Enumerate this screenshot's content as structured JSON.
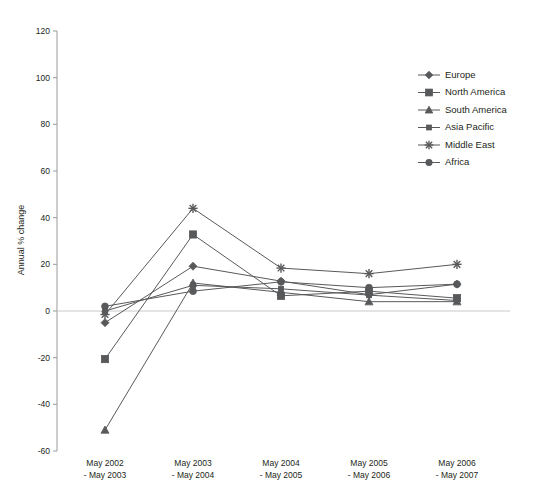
{
  "chart_data": {
    "type": "line",
    "title": "",
    "subtitle": "",
    "xlabel": "",
    "ylabel": "Annual % change",
    "ylim": [
      -60,
      120
    ],
    "yticks": [
      -60,
      -40,
      -20,
      0,
      20,
      40,
      60,
      80,
      100,
      120
    ],
    "ytick_labels": [
      "-60",
      "-40",
      "-20",
      "0",
      "20",
      "40",
      "60",
      "80",
      "100",
      "120"
    ],
    "grid": false,
    "zero_line": true,
    "legend_position": "top-right",
    "categories": [
      "May 2002\n- May 2003",
      "May 2003\n- May 2004",
      "May 2004\n- May 2005",
      "May 2005\n- May 2006",
      "May 2006\n- May 2007"
    ],
    "category_lines": [
      [
        "May 2002",
        "- May 2003"
      ],
      [
        "May 2003",
        "- May 2004"
      ],
      [
        "May 2004",
        "- May 2005"
      ],
      [
        "May 2005",
        "- May 2006"
      ],
      [
        "May 2006",
        "- May 2007"
      ]
    ],
    "series": [
      {
        "name": "Europe",
        "marker": "diamond",
        "color": "#58595b",
        "values": [
          -5.0,
          19.2,
          12.8,
          7.0,
          11.5
        ]
      },
      {
        "name": "North America",
        "marker": "square",
        "color": "#58595b",
        "values": [
          -20.6,
          32.8,
          6.5,
          8.5,
          5.5
        ]
      },
      {
        "name": "South America",
        "marker": "triangle",
        "color": "#58595b",
        "values": [
          -51.0,
          12.0,
          8.0,
          4.0,
          4.0
        ]
      },
      {
        "name": "Asia Pacific",
        "marker": "small-square",
        "color": "#58595b",
        "values": [
          0.0,
          11.0,
          9.5,
          6.8,
          4.5
        ]
      },
      {
        "name": "Middle East",
        "marker": "star",
        "color": "#58595b",
        "values": [
          -1.5,
          44.0,
          18.4,
          16.0,
          20.0
        ]
      },
      {
        "name": "Africa",
        "marker": "circle",
        "color": "#58595b",
        "values": [
          2.0,
          8.5,
          12.5,
          10.0,
          11.5
        ]
      }
    ]
  },
  "axis": {
    "y_title": "Annual % change"
  },
  "legend": {
    "entries": [
      {
        "label": "Europe"
      },
      {
        "label": "North America"
      },
      {
        "label": "South America"
      },
      {
        "label": "Asia Pacific"
      },
      {
        "label": "Middle East"
      },
      {
        "label": "Africa"
      }
    ]
  }
}
